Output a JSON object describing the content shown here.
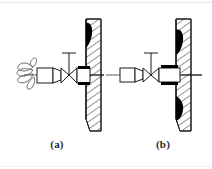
{
  "figure": {
    "background_color": "#ffffff",
    "ink_color": "#1a1a1a",
    "blob_color": "#000000",
    "hatch_color": "#3a3a3a",
    "width_px": 212,
    "height_px": 169,
    "panels": [
      {
        "id": "a",
        "caption": "(a)",
        "description": "Nozzle with open spray cloud discharging to the left, valve with T-handle, mounted through a hatched wall with a single dark deposit at the top",
        "elements": {
          "spray_label": "spray-cloud",
          "nozzle_label": "nozzle-body",
          "valve_label": "valve-symbol",
          "handle_label": "valve-handle",
          "barrel_label": "barrel-section",
          "wall_label": "hatched-wall",
          "deposit_count": 1,
          "centerline_label": "centerline"
        }
      },
      {
        "id": "b",
        "caption": "(b)",
        "description": "Nozzle without spray, valve with T-handle, mounted through a hatched wall with two dark deposits, at the top and bottom",
        "elements": {
          "nozzle_label": "nozzle-body",
          "valve_label": "valve-symbol",
          "handle_label": "valve-handle",
          "barrel_label": "barrel-section",
          "wall_label": "hatched-wall",
          "deposit_count": 2,
          "centerline_label": "centerline"
        }
      }
    ]
  }
}
